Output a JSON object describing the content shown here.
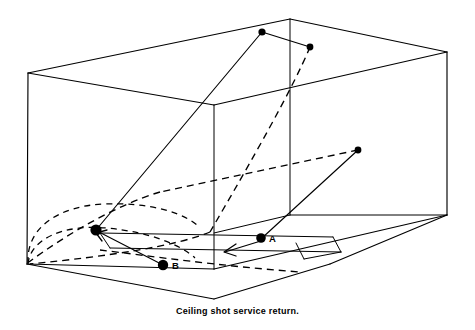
{
  "figure": {
    "caption": "Ceiling shot service return.",
    "title": "Ceiling shot service return",
    "background_color": "#ffffff",
    "line_color": "#000000"
  },
  "labels": {
    "point_a": "A",
    "point_b": "B"
  },
  "diagram": {
    "type": "racquetball-court-perspective-wireframe",
    "court": {
      "front_wall_top_left": [
        28,
        73
      ],
      "front_wall_bottom_left": [
        27,
        264
      ],
      "ceiling_back_left": [
        214,
        105
      ],
      "ceiling_back_top": [
        290,
        19
      ],
      "ceiling_right_far": [
        447,
        52
      ],
      "floor_back_left": [
        214,
        269
      ],
      "floor_back_right": [
        330,
        237
      ],
      "floor_right_near": [
        447,
        215
      ],
      "side_wall_corner": [
        290,
        215
      ]
    },
    "service_box_lines": [
      "short-line",
      "service-line",
      "service-box-divider"
    ]
  },
  "elements": {
    "ceiling_contact_dot": {
      "name": "ceiling-contact-point",
      "x": 262,
      "y": 32
    },
    "ceiling_rebound_dot": {
      "name": "ceiling-rebound-point",
      "x": 310,
      "y": 47
    },
    "side_target_dot": {
      "name": "side-wall-target-point",
      "x": 358,
      "y": 150
    },
    "player_a_dot": {
      "name": "player-a-position",
      "x": 262,
      "y": 238,
      "label": "A"
    },
    "player_b_dot": {
      "name": "player-b-position",
      "x": 163,
      "y": 265,
      "label": "B"
    },
    "front_wall_contact_dot": {
      "name": "front-wall-contact-point",
      "x": 96,
      "y": 230
    }
  },
  "trajectories": [
    {
      "name": "ceiling-shot-up",
      "style": "solid",
      "from": "front-wall-contact-point",
      "to": "ceiling-contact-point"
    },
    {
      "name": "ceiling-rebound",
      "style": "solid",
      "from": "ceiling-contact-point",
      "to": "ceiling-rebound-point"
    },
    {
      "name": "ball-descent-to-floor",
      "style": "dashed",
      "from": "ceiling-rebound-point",
      "to": "floor-back-left"
    },
    {
      "name": "return-path-to-side",
      "style": "solid",
      "from": "player-a-position",
      "to": "side-wall-target-point"
    },
    {
      "name": "return-rebound-dashed",
      "style": "dashed",
      "from": "side-wall-target-point",
      "to": "front-left-corner"
    },
    {
      "name": "player-b-approach",
      "style": "solid",
      "from": "player-b-position",
      "to": "front-wall-contact-point",
      "arrow": true
    },
    {
      "name": "rebound-arc-upper",
      "style": "dashed-arc",
      "from": "front-left-corner",
      "to": "mid-court"
    },
    {
      "name": "rebound-arc-lower",
      "style": "dashed-arc",
      "from": "front-left-corner",
      "to": "mid-court"
    },
    {
      "name": "player-a-movement-arrow",
      "style": "solid",
      "arrow": true,
      "direction": "left-down"
    }
  ]
}
